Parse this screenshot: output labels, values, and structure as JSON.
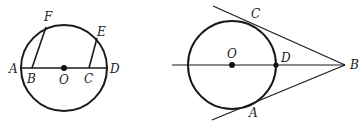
{
  "figures": [
    {
      "id": "figure-left",
      "description": "Circle with center O, diameter AD, chords-like segments BF and CE",
      "labels": {
        "A": "A",
        "B": "B",
        "C": "C",
        "D": "D",
        "E": "E",
        "F": "F",
        "O": "O"
      }
    },
    {
      "id": "figure-right",
      "description": "Circle with center O, tangent lines BC and BA from external point B, line through O and D to B",
      "labels": {
        "A": "A",
        "B": "B",
        "C": "C",
        "D": "D",
        "O": "O"
      }
    }
  ],
  "colors": {
    "stroke": "#1a1a1a",
    "background": "#ffffff"
  }
}
